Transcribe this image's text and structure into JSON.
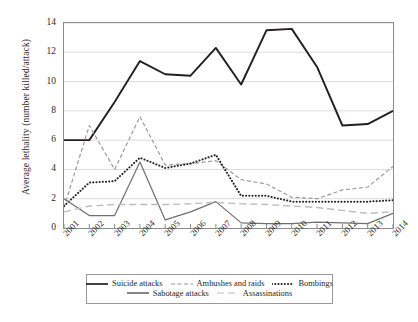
{
  "chart_data": {
    "type": "line",
    "title": "",
    "xlabel": "",
    "ylabel": "Average lethality (number killed/attack)",
    "categories": [
      "2001",
      "2002",
      "2003",
      "2004",
      "2005",
      "2006",
      "2007",
      "2008",
      "2009",
      "2010",
      "2011",
      "2012",
      "2013",
      "2014"
    ],
    "x": [
      2001,
      2002,
      2003,
      2004,
      2005,
      2006,
      2007,
      2008,
      2009,
      2010,
      2011,
      2012,
      2013,
      2014
    ],
    "ylim": [
      0,
      14
    ],
    "xlim": [
      2001,
      2014
    ],
    "yticks": [
      0,
      2,
      4,
      6,
      8,
      10,
      12,
      14
    ],
    "grid": "horizontal",
    "legend_position": "bottom",
    "series": [
      {
        "name": "Suicide attacks",
        "style": "solid",
        "color": "#231f20",
        "width": 1.9,
        "values": [
          6.0,
          6.0,
          8.6,
          11.4,
          10.5,
          10.4,
          12.3,
          9.8,
          13.5,
          13.6,
          11.0,
          7.0,
          7.1,
          8.0
        ]
      },
      {
        "name": "Ambushes and raids",
        "style": "dashed",
        "color": "#9a9a9a",
        "width": 1.2,
        "values": [
          1.4,
          7.0,
          4.0,
          7.6,
          4.3,
          4.4,
          4.6,
          3.3,
          3.0,
          2.1,
          2.0,
          2.6,
          2.8,
          4.2
        ]
      },
      {
        "name": "Bombings",
        "style": "dotted",
        "color": "#231f20",
        "width": 2.0,
        "values": [
          1.5,
          3.1,
          3.2,
          4.8,
          4.1,
          4.4,
          5.0,
          2.2,
          2.2,
          1.8,
          1.8,
          1.8,
          1.8,
          1.9
        ]
      },
      {
        "name": "Sabotage attacks",
        "style": "solid",
        "color": "#6f6f6f",
        "width": 1.2,
        "values": [
          2.0,
          0.85,
          0.85,
          4.5,
          0.55,
          1.1,
          1.8,
          0.35,
          0.3,
          0.3,
          0.4,
          0.35,
          0.3,
          1.0
        ]
      },
      {
        "name": "Assassinations",
        "style": "longdash",
        "color": "#bdbdbd",
        "width": 1.4,
        "values": [
          1.1,
          1.5,
          1.6,
          1.6,
          1.6,
          1.65,
          1.75,
          1.65,
          1.6,
          1.5,
          1.4,
          1.2,
          1.0,
          1.1
        ]
      }
    ]
  },
  "legend": {
    "row1": [
      {
        "label": "Suicide attacks",
        "style": "solid",
        "color": "#231f20"
      },
      {
        "label": "Ambushes and raids",
        "style": "dashed",
        "color": "#9a9a9a"
      },
      {
        "label": "Bombings",
        "style": "dotted",
        "color": "#231f20"
      }
    ],
    "row2": [
      {
        "label": "Sabotage attacks",
        "style": "solid",
        "color": "#6f6f6f"
      },
      {
        "label": "Assassinations",
        "style": "longdash",
        "color": "#bdbdbd"
      }
    ]
  }
}
